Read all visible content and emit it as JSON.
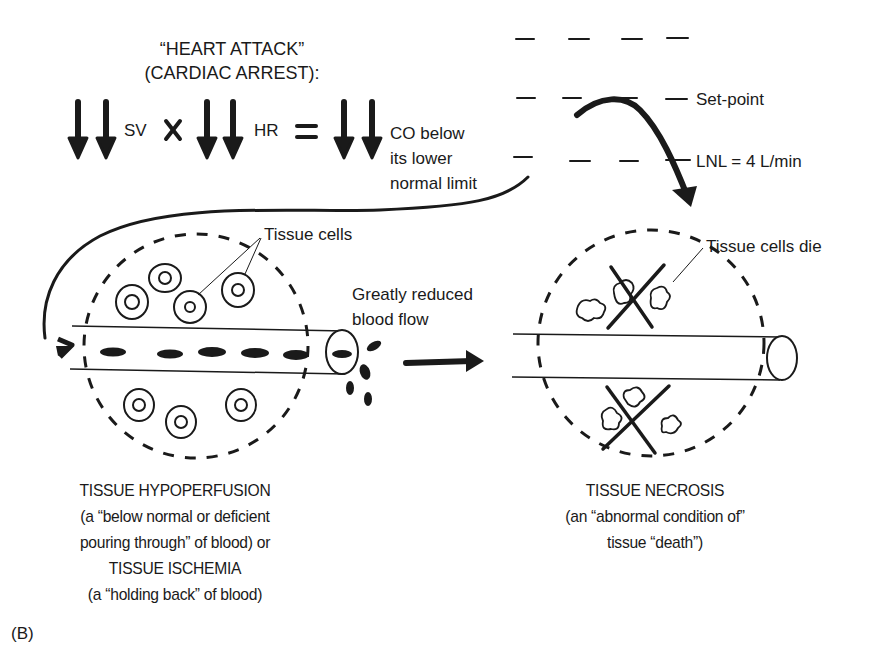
{
  "title": {
    "line1": "“HEART ATTACK”",
    "line2": "(CARDIAC ARREST):"
  },
  "equation": {
    "term1": "SV",
    "operator1": "×",
    "term2": "HR",
    "operator2": "=",
    "result_line1": "CO below",
    "result_line2": "its lower",
    "result_line3": "normal limit",
    "arrow_meaning": "double-down-arrow (greatly decreased)"
  },
  "gauge": {
    "setpoint_label": "Set-point",
    "lnl_label": "LNL = 4 L/min"
  },
  "left_panel": {
    "cells_label": "Tissue cells",
    "flow_label_line1": "Greatly reduced",
    "flow_label_line2": "blood flow",
    "caption": [
      "TISSUE HYPOPERFUSION",
      "(a “below normal or deficient",
      "pouring through” of blood) or",
      "TISSUE ISCHEMIA",
      "(a “holding back” of blood)"
    ]
  },
  "right_panel": {
    "cells_label": "Tissue cells die",
    "caption": [
      "TISSUE NECROSIS",
      "(an “abnormal condition of”",
      "tissue “death”)"
    ]
  },
  "figure_label": "(B)",
  "colors": {
    "ink": "#1a1a1a",
    "background": "#ffffff"
  }
}
